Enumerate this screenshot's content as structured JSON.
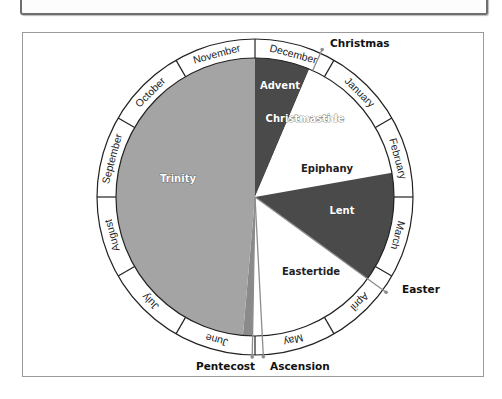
{
  "diagram": {
    "center": [
      255,
      197
    ],
    "outer_radius": 158,
    "inner_radius": 139,
    "months": [
      {
        "label": "December",
        "start": 0
      },
      {
        "label": "January",
        "start": 30
      },
      {
        "label": "February",
        "start": 60
      },
      {
        "label": "March",
        "start": 90
      },
      {
        "label": "April",
        "start": 120
      },
      {
        "label": "May",
        "start": 150
      },
      {
        "label": "June",
        "start": 180
      },
      {
        "label": "July",
        "start": 210
      },
      {
        "label": "August",
        "start": 240
      },
      {
        "label": "September",
        "start": 270
      },
      {
        "label": "October",
        "start": 300
      },
      {
        "label": "November",
        "start": 330
      }
    ],
    "seasons": [
      {
        "label": "Advent",
        "start": 0,
        "end": 23,
        "color": "#4a4a4a"
      },
      {
        "label": "Christmastide",
        "start": 23,
        "end": 50,
        "color": "#ffffff"
      },
      {
        "label": "Epiphany",
        "start": 50,
        "end": 80,
        "color": "#ffffff"
      },
      {
        "label": "Lent",
        "start": 80,
        "end": 126,
        "color": "#4a4a4a"
      },
      {
        "label": "Eastertide",
        "start": 126,
        "end": 181,
        "color": "#ffffff"
      },
      {
        "label": "Pentecost-band",
        "start": 181,
        "end": 185,
        "color": "#8a8a8a"
      },
      {
        "label": "Trinity",
        "start": 185,
        "end": 360,
        "color": "#a4a4a4"
      }
    ],
    "season_labels": {
      "advent": "Advent",
      "christmastide": "Christmastide",
      "epiphany": "Epiphany",
      "lent": "Lent",
      "eastertide": "Eastertide",
      "trinity": "Trinity"
    },
    "feasts": {
      "christmas": "Christmas",
      "easter": "Easter",
      "pentecost": "Pentecost",
      "ascension": "Ascension"
    },
    "colors": {
      "dark_season": "#4a4a4a",
      "trinity": "#a4a4a4",
      "pentecost_band": "#8a8a8a",
      "marker": "#8c8c8c",
      "ring_stroke": "#222222"
    }
  }
}
